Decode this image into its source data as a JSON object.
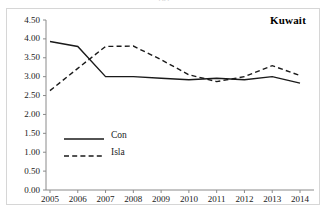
{
  "figure": {
    "caption_partial": "(a)",
    "series_title": "Kuwait"
  },
  "legend": {
    "position": "inside-left",
    "entries": [
      {
        "label": "Con",
        "style": "solid",
        "swatch_name": "legend-swatch-solid"
      },
      {
        "label": "Isla",
        "style": "dashed",
        "swatch_name": "legend-swatch-dashed"
      }
    ]
  },
  "axes": {
    "y_ticks": [
      "4.50",
      "4.00",
      "3.50",
      "3.00",
      "2.50",
      "2.00",
      "1.50",
      "1.00",
      "0.50",
      "0.00"
    ],
    "x_ticks": [
      "2005",
      "2006",
      "2007",
      "2008",
      "2009",
      "2010",
      "2011",
      "2012",
      "2013",
      "2014"
    ]
  },
  "colors": {
    "line": "#1a1a1a",
    "frame": "#d6d6d6",
    "axis": "#808080",
    "text": "#1a1a1a"
  },
  "chart_data": {
    "type": "line",
    "title": "Kuwait",
    "xlabel": "",
    "ylabel": "",
    "x": [
      2005,
      2006,
      2007,
      2008,
      2009,
      2010,
      2011,
      2012,
      2013,
      2014
    ],
    "categories": [
      "2005",
      "2006",
      "2007",
      "2008",
      "2009",
      "2010",
      "2011",
      "2012",
      "2013",
      "2014"
    ],
    "series": [
      {
        "name": "Con",
        "style": "solid",
        "values": [
          3.93,
          3.8,
          3.0,
          3.0,
          2.96,
          2.92,
          2.96,
          2.92,
          3.0,
          2.83
        ]
      },
      {
        "name": "Isla",
        "style": "dashed",
        "values": [
          2.63,
          3.22,
          3.8,
          3.81,
          3.45,
          3.05,
          2.87,
          3.0,
          3.29,
          3.03
        ]
      }
    ],
    "ylim": [
      0.0,
      4.5
    ],
    "ytick_step": 0.5,
    "xlim": [
      2005,
      2014
    ],
    "grid": false,
    "legend_position": "inside-left"
  }
}
